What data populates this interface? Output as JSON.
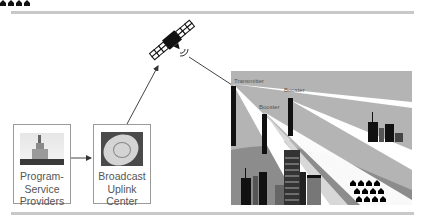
{
  "diagram": {
    "type": "satellite-radio-broadcast-flow",
    "nodes": {
      "providers": {
        "label_lines": [
          "Program-",
          "Service",
          "Providers"
        ],
        "icon": "city-tower-photo"
      },
      "uplink": {
        "label_lines": [
          "Broadcast",
          "Uplink",
          "Center"
        ],
        "icon": "satellite-dish-photo"
      },
      "satellite": {
        "icon": "satellite-icon"
      },
      "city": {
        "transmitter_label": "Transmitter",
        "booster_labels": [
          "Booster",
          "Booster"
        ]
      }
    },
    "edges": [
      {
        "from": "providers",
        "to": "uplink"
      },
      {
        "from": "uplink",
        "to": "satellite"
      },
      {
        "from": "satellite",
        "to": "city"
      }
    ],
    "colors": {
      "rule": "#c8c8c8",
      "box_border": "#9a9a9a",
      "text": "#555555",
      "sky": "#b4b4b4",
      "beam": "#ffffff",
      "coverage_dark": "#8c8c8c",
      "building": "#111111"
    }
  }
}
